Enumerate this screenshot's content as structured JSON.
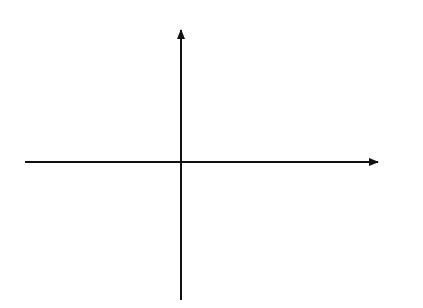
{
  "figure": {
    "axes": {
      "x_label": "x",
      "y_label": "y"
    },
    "curves": {
      "asymptote_pos": "y = x",
      "asymptote_neg": "y = - x",
      "hyperbola_left_label": {
        "base": "x",
        "exp1": "2",
        "mid": "- y",
        "exp2": "2",
        "eq": "=c",
        "exp3": "2"
      },
      "hyperbola_right_label": {
        "base": "x",
        "exp1": "2",
        "mid": "- y",
        "exp2": "2",
        "eq": "=c",
        "exp3": "2"
      },
      "rect_hyperbola_top_label": {
        "text": "xy = c",
        "exp": "2"
      },
      "rect_hyperbola_bottom_label": "xy = c2"
    },
    "points": {
      "A": "A",
      "B": "B",
      "C": "C",
      "D": "D",
      "E": "E",
      "F": "F",
      "P": "P"
    },
    "lines": {
      "tangent_label": "Tangent at P",
      "normal_label_line1": "Normal",
      "normal_label_line2": "at P"
    }
  }
}
